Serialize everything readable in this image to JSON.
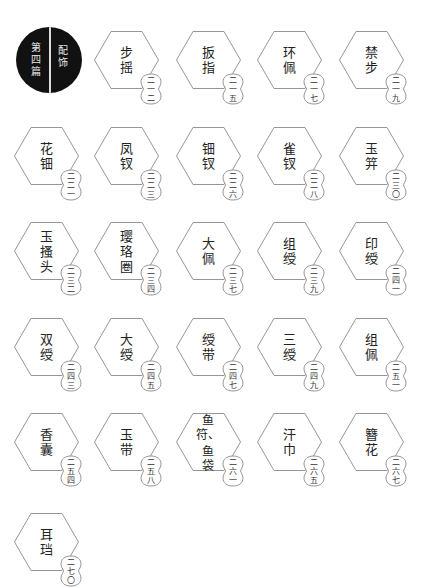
{
  "chapter": {
    "number_chars": [
      "第",
      "四",
      "篇"
    ],
    "title_chars": [
      "配",
      "饰"
    ],
    "colors": {
      "background": "#111111",
      "text": "#e8e8e8",
      "divider": "#dddddd"
    }
  },
  "colors": {
    "hex_stroke": "#8a8a8a",
    "badge_stroke": "#8a8a8a",
    "text": "#222222"
  },
  "items": [
    {
      "name": "步摇",
      "chars": [
        "步",
        "摇"
      ],
      "page": [
        "二",
        "一",
        "二"
      ],
      "col": 1,
      "row": 0
    },
    {
      "name": "扳指",
      "chars": [
        "扳",
        "指"
      ],
      "page": [
        "二",
        "一",
        "五"
      ],
      "col": 2,
      "row": 0
    },
    {
      "name": "环佩",
      "chars": [
        "环",
        "佩"
      ],
      "page": [
        "二",
        "一",
        "七"
      ],
      "col": 3,
      "row": 0
    },
    {
      "name": "禁步",
      "chars": [
        "禁",
        "步"
      ],
      "page": [
        "二",
        "一",
        "九"
      ],
      "col": 4,
      "row": 0
    },
    {
      "name": "花钿",
      "chars": [
        "花",
        "钿"
      ],
      "page": [
        "二",
        "二",
        "一"
      ],
      "col": 0,
      "row": 1
    },
    {
      "name": "凤钗",
      "chars": [
        "凤",
        "钗"
      ],
      "page": [
        "二",
        "二",
        "三"
      ],
      "col": 1,
      "row": 1
    },
    {
      "name": "钿钗",
      "chars": [
        "钿",
        "钗"
      ],
      "page": [
        "二",
        "二",
        "六"
      ],
      "col": 2,
      "row": 1
    },
    {
      "name": "雀钗",
      "chars": [
        "雀",
        "钗"
      ],
      "page": [
        "二",
        "二",
        "八"
      ],
      "col": 3,
      "row": 1
    },
    {
      "name": "玉笄",
      "chars": [
        "玉",
        "笄"
      ],
      "page": [
        "二",
        "三",
        "〇"
      ],
      "col": 4,
      "row": 1
    },
    {
      "name": "玉搔头",
      "chars": [
        "玉",
        "搔",
        "头"
      ],
      "page": [
        "二",
        "三",
        "二"
      ],
      "col": 0,
      "row": 2
    },
    {
      "name": "璎珞圈",
      "chars": [
        "璎",
        "珞",
        "圈"
      ],
      "page": [
        "二",
        "三",
        "四"
      ],
      "col": 1,
      "row": 2
    },
    {
      "name": "大佩",
      "chars": [
        "大",
        "佩"
      ],
      "page": [
        "二",
        "三",
        "七"
      ],
      "col": 2,
      "row": 2
    },
    {
      "name": "组绶",
      "chars": [
        "组",
        "绶"
      ],
      "page": [
        "二",
        "三",
        "九"
      ],
      "col": 3,
      "row": 2
    },
    {
      "name": "印绶",
      "chars": [
        "印",
        "绶"
      ],
      "page": [
        "二",
        "四",
        "一"
      ],
      "col": 4,
      "row": 2
    },
    {
      "name": "双绶",
      "chars": [
        "双",
        "绶"
      ],
      "page": [
        "二",
        "四",
        "三"
      ],
      "col": 0,
      "row": 3
    },
    {
      "name": "大绶",
      "chars": [
        "大",
        "绶"
      ],
      "page": [
        "二",
        "四",
        "五"
      ],
      "col": 1,
      "row": 3
    },
    {
      "name": "绶带",
      "chars": [
        "绶",
        "带"
      ],
      "page": [
        "二",
        "四",
        "七"
      ],
      "col": 2,
      "row": 3
    },
    {
      "name": "三绶",
      "chars": [
        "三",
        "绶"
      ],
      "page": [
        "二",
        "四",
        "九"
      ],
      "col": 3,
      "row": 3
    },
    {
      "name": "组佩",
      "chars": [
        "组",
        "佩"
      ],
      "page": [
        "二",
        "五",
        "一"
      ],
      "col": 4,
      "row": 3
    },
    {
      "name": "香囊",
      "chars": [
        "香",
        "囊"
      ],
      "page": [
        "二",
        "五",
        "四"
      ],
      "col": 0,
      "row": 4
    },
    {
      "name": "玉带",
      "chars": [
        "玉",
        "带"
      ],
      "page": [
        "二",
        "五",
        "八"
      ],
      "col": 1,
      "row": 4
    },
    {
      "name": "鱼符、鱼袋",
      "chars": [
        "鱼",
        "符、",
        "",
        "鱼",
        "袋"
      ],
      "page": [
        "二",
        "六",
        "一"
      ],
      "col": 2,
      "row": 4,
      "tight": true
    },
    {
      "name": "汗巾",
      "chars": [
        "汗",
        "巾"
      ],
      "page": [
        "二",
        "六",
        "五"
      ],
      "col": 3,
      "row": 4
    },
    {
      "name": "簪花",
      "chars": [
        "簪",
        "花"
      ],
      "page": [
        "二",
        "六",
        "七"
      ],
      "col": 4,
      "row": 4
    },
    {
      "name": "耳珰",
      "chars": [
        "耳",
        "珰"
      ],
      "page": [
        "二",
        "七",
        "〇"
      ],
      "col": 0,
      "row": 5
    }
  ]
}
